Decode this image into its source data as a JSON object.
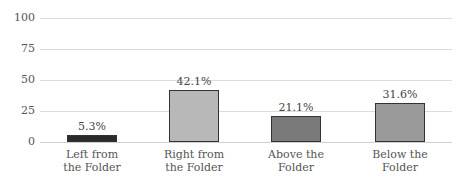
{
  "chart_data": {
    "type": "bar",
    "title": "",
    "xlabel": "",
    "ylabel": "",
    "ylim": [
      0,
      100
    ],
    "yticks": [
      "0",
      "25",
      "50",
      "75",
      "100"
    ],
    "grid": true,
    "legend": null,
    "categories": [
      "Left from the Folder",
      "Right from the Folder",
      "Above the Folder",
      "Below the Folder"
    ],
    "category_lines": [
      [
        "Left from",
        "the Folder"
      ],
      [
        "Right from",
        "the Folder"
      ],
      [
        "Above the",
        "Folder"
      ],
      [
        "Below the",
        "Folder"
      ]
    ],
    "values": [
      5.3,
      42.1,
      21.1,
      31.6
    ],
    "value_labels": [
      "5.3%",
      "42.1%",
      "21.1%",
      "31.6%"
    ],
    "colors": [
      "#2b2b2b",
      "#b8b8b8",
      "#7a7a7a",
      "#9a9a9a"
    ]
  }
}
